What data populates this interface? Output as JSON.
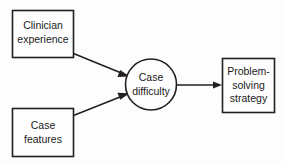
{
  "diagram": {
    "background_color": "#fdfdfd",
    "stroke_color": "#231f20",
    "node_fill_color": "#fefefe",
    "text_color": "#1a1a1a",
    "nodes": {
      "clinician_experience": {
        "shape": "rectangle",
        "line1": "Clinician",
        "line2": "experience"
      },
      "case_features": {
        "shape": "rectangle",
        "line1": "Case",
        "line2": "features"
      },
      "case_difficulty": {
        "shape": "circle",
        "line1": "Case",
        "line2": "difficulty"
      },
      "problem_solving_strategy": {
        "shape": "rectangle",
        "line1": "Problem-",
        "line2": "solving",
        "line3": "strategy"
      }
    },
    "edges": [
      {
        "id": "clinician-experience-to-case-difficulty",
        "from": "clinician_experience",
        "to": "case_difficulty",
        "style": "solid-arrow",
        "label": ""
      },
      {
        "id": "case-features-to-case-difficulty",
        "from": "case_features",
        "to": "case_difficulty",
        "style": "solid-arrow",
        "label": ""
      },
      {
        "id": "case-difficulty-to-problem-solving-strategy",
        "from": "case_difficulty",
        "to": "problem_solving_strategy",
        "style": "solid-arrow",
        "label": ""
      }
    ]
  }
}
